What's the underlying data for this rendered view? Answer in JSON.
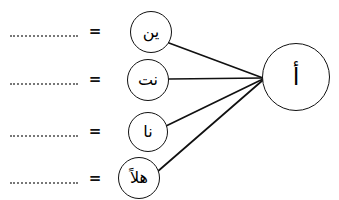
{
  "page": {
    "width": 339,
    "height": 200,
    "background_color": "#ffffff",
    "ink_color": "#111111",
    "blank_color": "#777777"
  },
  "target": {
    "label": "أ",
    "name": "alif-hamza",
    "cx": 296,
    "cy": 77,
    "r": 34
  },
  "rows": [
    {
      "blank": "",
      "equals": "=",
      "circle_label": "ين",
      "circle_name": "syllable-yeen",
      "cx": 151,
      "cy": 32,
      "r": 21,
      "blank_y": 33,
      "equals_x": 88,
      "equals_y": 24
    },
    {
      "blank": "",
      "equals": "=",
      "circle_label": "نت",
      "circle_name": "syllable-nt",
      "cx": 148,
      "cy": 80,
      "r": 21,
      "blank_y": 81,
      "equals_x": 88,
      "equals_y": 72
    },
    {
      "blank": "",
      "equals": "=",
      "circle_label": "نا",
      "circle_name": "syllable-naa",
      "cx": 148,
      "cy": 132,
      "r": 20,
      "blank_y": 133,
      "equals_x": 88,
      "equals_y": 124
    },
    {
      "blank": "",
      "equals": "=",
      "circle_label": "هلاً",
      "circle_name": "word-halan",
      "cx": 139,
      "cy": 178,
      "r": 21,
      "blank_y": 180,
      "equals_x": 88,
      "equals_y": 171
    }
  ],
  "connections": [
    {
      "name": "edge-yeen-to-alif",
      "from": "syllable-yeen",
      "to": "alif-hamza",
      "x1": 169,
      "y1": 43,
      "x2": 263,
      "y2": 78
    },
    {
      "name": "edge-nt-to-alif",
      "from": "syllable-nt",
      "to": "alif-hamza",
      "x1": 169,
      "y1": 79,
      "x2": 263,
      "y2": 78
    },
    {
      "name": "edge-naa-to-alif",
      "from": "syllable-naa",
      "to": "alif-hamza",
      "x1": 166,
      "y1": 126,
      "x2": 263,
      "y2": 79
    },
    {
      "name": "edge-halan-to-alif",
      "from": "word-halan",
      "to": "alif-hamza",
      "x1": 157,
      "y1": 172,
      "x2": 263,
      "y2": 80
    }
  ],
  "blank_geometry": {
    "x": 10,
    "width": 68
  }
}
